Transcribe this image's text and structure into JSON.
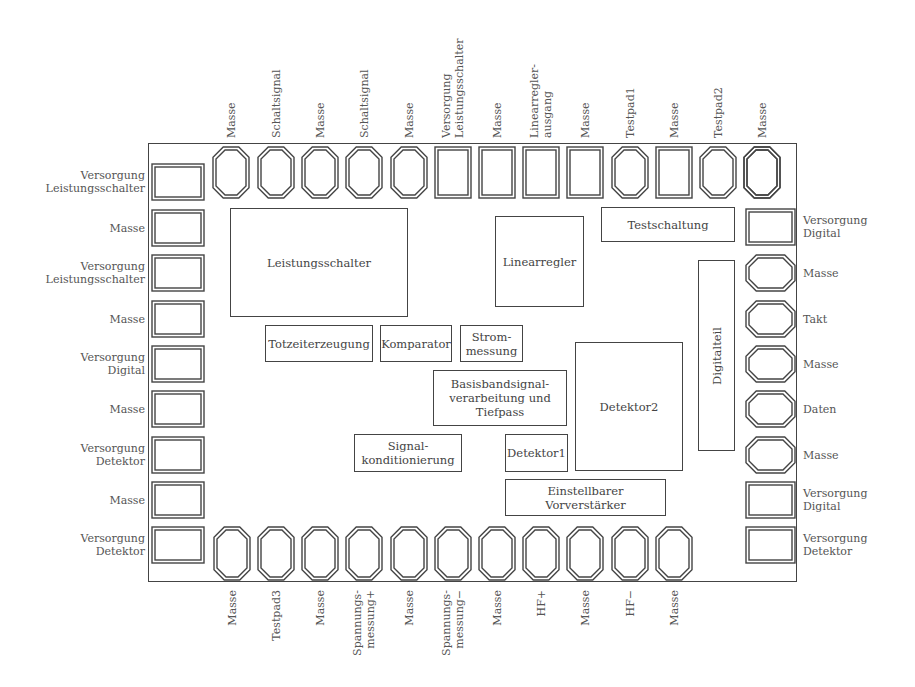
{
  "diagram": {
    "chip_outline": {
      "x": 148,
      "y": 143,
      "w": 649,
      "h": 439
    },
    "blocks": [
      {
        "id": "leistungsschalter",
        "label": "Leistungsschalter",
        "x": 230,
        "y": 208,
        "w": 178,
        "h": 109,
        "vertical": false
      },
      {
        "id": "linearregler",
        "label": "Linearregler",
        "x": 495,
        "y": 216,
        "w": 89,
        "h": 91,
        "vertical": false
      },
      {
        "id": "testschaltung",
        "label": "Testschaltung",
        "x": 601,
        "y": 207,
        "w": 134,
        "h": 35,
        "vertical": false
      },
      {
        "id": "digitalteil",
        "label": "Digitalteil",
        "x": 698,
        "y": 260,
        "w": 37,
        "h": 191,
        "vertical": true
      },
      {
        "id": "totzeiterzeugung",
        "label": "Totzeiterzeugung",
        "x": 265,
        "y": 325,
        "w": 108,
        "h": 37,
        "vertical": false
      },
      {
        "id": "komparator",
        "label": "Komparator",
        "x": 380,
        "y": 325,
        "w": 72,
        "h": 37,
        "vertical": false
      },
      {
        "id": "strommessung",
        "label": "Strom-\nmessung",
        "x": 460,
        "y": 325,
        "w": 63,
        "h": 37,
        "vertical": false
      },
      {
        "id": "basisband",
        "label": "Basisbandsignal-\nverarbeitung und\nTiefpass",
        "x": 433,
        "y": 370,
        "w": 134,
        "h": 56,
        "vertical": false
      },
      {
        "id": "detektor2",
        "label": "Detektor2",
        "x": 575,
        "y": 342,
        "w": 108,
        "h": 129,
        "vertical": false
      },
      {
        "id": "signalkonditionierung",
        "label": "Signal-\nkonditionierung",
        "x": 354,
        "y": 434,
        "w": 108,
        "h": 38,
        "vertical": false
      },
      {
        "id": "detektor1",
        "label": "Detektor1",
        "x": 505,
        "y": 434,
        "w": 63,
        "h": 38,
        "vertical": false
      },
      {
        "id": "vorverstaerker",
        "label": "Einstellbarer Vorverstärker",
        "x": 505,
        "y": 479,
        "w": 161,
        "h": 37,
        "vertical": false
      }
    ],
    "pads_top": [
      {
        "label": "Masse",
        "shape": "oct"
      },
      {
        "label": "Schaltsignal",
        "shape": "oct"
      },
      {
        "label": "Masse",
        "shape": "oct"
      },
      {
        "label": "Schaltsignal",
        "shape": "oct"
      },
      {
        "label": "Masse",
        "shape": "oct"
      },
      {
        "label": "Versorgung\nLeistungsschalter",
        "shape": "rect"
      },
      {
        "label": "Masse",
        "shape": "rect"
      },
      {
        "label": "Linearregler-\nausgang",
        "shape": "rect"
      },
      {
        "label": "Masse",
        "shape": "rect"
      },
      {
        "label": "Testpad1",
        "shape": "oct"
      },
      {
        "label": "Masse",
        "shape": "rect"
      },
      {
        "label": "Testpad2",
        "shape": "oct"
      },
      {
        "label": "Masse",
        "shape": "oct"
      }
    ],
    "pads_bottom": [
      {
        "label": "Masse",
        "shape": "oct"
      },
      {
        "label": "Testpad3",
        "shape": "oct"
      },
      {
        "label": "Masse",
        "shape": "oct"
      },
      {
        "label": "Spannungs-\nmessung+",
        "shape": "oct"
      },
      {
        "label": "Masse",
        "shape": "oct"
      },
      {
        "label": "Spannungs-\nmessung−",
        "shape": "oct"
      },
      {
        "label": "Masse",
        "shape": "oct"
      },
      {
        "label": "HF+",
        "shape": "oct"
      },
      {
        "label": "Masse",
        "shape": "oct"
      },
      {
        "label": "HF−",
        "shape": "oct"
      },
      {
        "label": "Masse",
        "shape": "oct"
      }
    ],
    "pads_left": [
      {
        "label": "Versorgung\nLeistungsschalter",
        "shape": "rect"
      },
      {
        "label": "Masse",
        "shape": "rect"
      },
      {
        "label": "Versorgung\nLeistungsschalter",
        "shape": "rect"
      },
      {
        "label": "Masse",
        "shape": "rect"
      },
      {
        "label": "Versorgung\nDigital",
        "shape": "rect"
      },
      {
        "label": "Masse",
        "shape": "rect"
      },
      {
        "label": "Versorgung\nDetektor",
        "shape": "rect"
      },
      {
        "label": "Masse",
        "shape": "rect"
      },
      {
        "label": "Versorgung\nDetektor",
        "shape": "rect"
      }
    ],
    "pads_right": [
      {
        "label": "",
        "shape": "oct_v"
      },
      {
        "label": "Versorgung\nDigital",
        "shape": "rect"
      },
      {
        "label": "Masse",
        "shape": "oct"
      },
      {
        "label": "Takt",
        "shape": "oct"
      },
      {
        "label": "Masse",
        "shape": "oct"
      },
      {
        "label": "Daten",
        "shape": "oct"
      },
      {
        "label": "Masse",
        "shape": "oct"
      },
      {
        "label": "Versorgung\nDigital",
        "shape": "rect"
      },
      {
        "label": "Versorgung\nDetektor",
        "shape": "rect"
      }
    ],
    "colors": {
      "outline": "#444444",
      "text": "#444444",
      "background": "#ffffff"
    }
  }
}
